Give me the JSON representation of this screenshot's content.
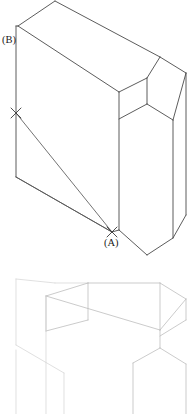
{
  "figure": {
    "type": "isometric-technical-drawing",
    "background_color": "#ffffff",
    "edge_color": "#4a4a4a",
    "ghost_edge_color": "#b9b9b9",
    "construction_line_color": "#5a5a5a"
  },
  "labels": {
    "point_a": "(A)",
    "point_b": "(B)"
  },
  "markers": {
    "cross_upper": {
      "name": "cross-mark-upper",
      "x": 16,
      "y": 113
    },
    "cross_lower": {
      "name": "cross-mark-lower",
      "x": 112,
      "y": 232
    }
  },
  "label_positions": {
    "point_b": {
      "x": 2,
      "y": 41
    },
    "point_a": {
      "x": 104,
      "y": 244
    }
  },
  "upper_solid": {
    "name": "stepped-block-solid",
    "top_face": "55,1 160,57 147,78 120,63 119,92 18,26",
    "front_face": "18,26 119,92 119,230 112,232 16,177 16,26",
    "right_upper_face": "119,92 147,78 147,104 119,119",
    "step_top_face": "147,78 160,57 186,73 173,94",
    "step_right_face": "173,94 186,73 186,215 173,238",
    "lower_right_face": "119,119 147,104 173,120 173,238 147,255 119,230",
    "outline": "55,1 160,57 186,73 186,215 147,255 112,232 16,177 16,26",
    "internal_edges": [
      "18,26 119,92",
      "119,92 119,230",
      "119,92 147,78",
      "147,78 160,57",
      "147,78 147,104",
      "147,104 173,120",
      "173,120 173,238",
      "173,120 186,73",
      "147,104 119,119",
      "147,255 147,238",
      "16,177 112,232",
      "18,26 16,26"
    ]
  },
  "construction_lines": [
    {
      "name": "construction-line-cross-to-a",
      "from_x": 16,
      "from_y": 113,
      "to_x": 112,
      "to_y": 232
    },
    {
      "name": "construction-line-vertex-to-a",
      "from_x": 16,
      "from_y": 177,
      "to_x": 112,
      "to_y": 232
    }
  ],
  "lower_ghost": {
    "name": "stepped-block-ghost",
    "description": "faded partial duplicate of the stepped block",
    "edges": [
      "16,279 46,296",
      "46,296 46,414",
      "16,279 16,345",
      "16,345 16,414",
      "16,345 64,373",
      "64,373 64,414",
      "46,296 160,330",
      "55,283 160,283",
      "88,283 160,330",
      "46,296 88,283",
      "88,283 88,320",
      "88,320 46,331",
      "46,331 46,296",
      "88,320 88,345",
      "16,279 55,283",
      "55,283 88,283",
      "160,283 186,299",
      "160,330 186,299",
      "160,330 160,348",
      "160,348 186,364",
      "186,364 186,414",
      "186,299 186,320",
      "160,348 133,363",
      "133,363 133,414",
      "186,320 160,336"
    ]
  }
}
